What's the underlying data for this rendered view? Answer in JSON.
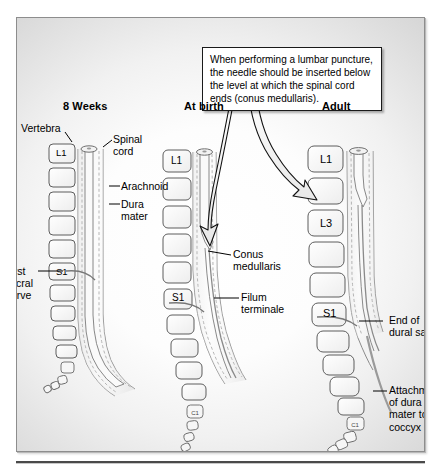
{
  "figure": {
    "callout": {
      "text": "When performing a lumbar puncture, the needle should be inserted below the level at which the spinal cord ends (conus medullaris)."
    },
    "columns": [
      {
        "id": "eight-weeks",
        "title": "8 Weeks",
        "vertebrae": [
          "L1",
          "",
          "",
          "",
          "",
          "S1",
          "",
          "",
          "",
          ""
        ],
        "labels": [
          "Vertebra",
          "Spinal\ncord",
          "Arachnoid",
          "Dura\nmater",
          "First\nsacral\nnerve"
        ]
      },
      {
        "id": "at-birth",
        "title": "At birth",
        "vertebrae": [
          "L1",
          "",
          "",
          "",
          "",
          "S1",
          "",
          "",
          "",
          "",
          "C1"
        ],
        "labels": [
          "Conus\nmedullaris",
          "Filum\nterminale"
        ]
      },
      {
        "id": "adult",
        "title": "Adult",
        "vertebrae": [
          "L1",
          "",
          "L3",
          "",
          "",
          "S1",
          "",
          "",
          "",
          "",
          "C1"
        ],
        "labels": [
          "End of\ndural sac",
          "Attachment\nof dura\nmater to\ncoccyx"
        ]
      }
    ],
    "annotations": {
      "vertebra": "Vertebra",
      "spinal_cord": "Spinal\ncord",
      "arachnoid": "Arachnoid",
      "dura_mater": "Dura\nmater",
      "first_sacral_nerve": "First\nsacral\nnerve",
      "conus_medullaris": "Conus\nmedullaris",
      "filum_terminale": "Filum\nterminale",
      "end_of_dural_sac": "End of\ndural sac",
      "attachment_coccyx": "Attachment\nof dura\nmater to\ncoccyx"
    },
    "titles": {
      "eight_weeks": "8 Weeks",
      "at_birth": "At birth",
      "adult": "Adult"
    },
    "colors": {
      "outline": "#6f6f6f",
      "cord_fill": "#f4f4f4",
      "dura_dash": "#b8b8b8",
      "text": "#000000",
      "frame_border": "#8d8d8d"
    }
  }
}
